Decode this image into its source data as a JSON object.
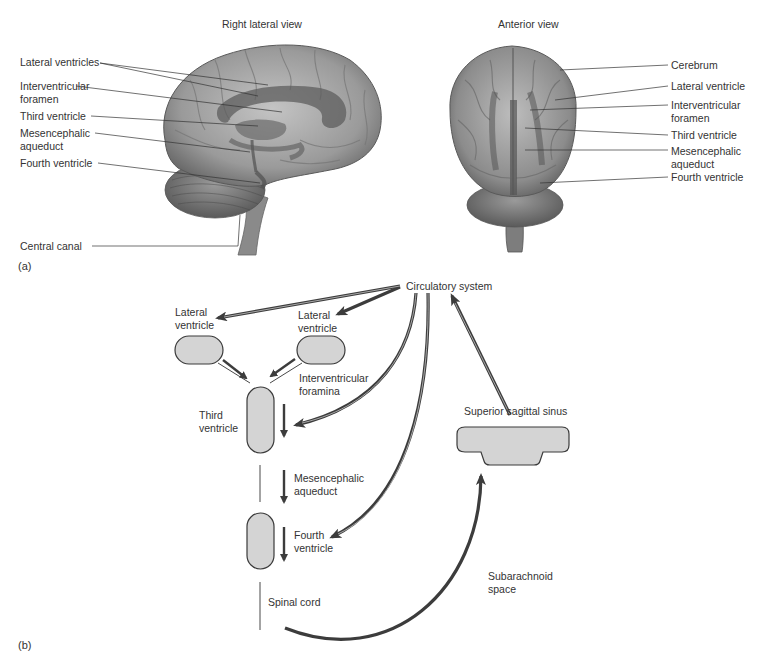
{
  "panel_a": {
    "part_label": "(a)",
    "lateral_view": {
      "title": "Right lateral view",
      "labels": [
        {
          "id": "lateral-ventricles",
          "lines": [
            "Lateral ventricles"
          ]
        },
        {
          "id": "interventricular-foramen",
          "lines": [
            "Interventricular",
            "foramen"
          ]
        },
        {
          "id": "third-ventricle",
          "lines": [
            "Third ventricle"
          ]
        },
        {
          "id": "mesencephalic-aqueduct",
          "lines": [
            "Mesencephalic",
            "aqueduct"
          ]
        },
        {
          "id": "fourth-ventricle",
          "lines": [
            "Fourth ventricle"
          ]
        },
        {
          "id": "central-canal",
          "lines": [
            "Central canal"
          ]
        }
      ]
    },
    "anterior_view": {
      "title": "Anterior view",
      "labels": [
        {
          "id": "cerebrum",
          "lines": [
            "Cerebrum"
          ]
        },
        {
          "id": "lateral-ventricle",
          "lines": [
            "Lateral ventricle"
          ]
        },
        {
          "id": "interventricular-foramen",
          "lines": [
            "Interventricular",
            "foramen"
          ]
        },
        {
          "id": "third-ventricle",
          "lines": [
            "Third ventricle"
          ]
        },
        {
          "id": "mesencephalic-aqueduct",
          "lines": [
            "Mesencephalic",
            "aqueduct"
          ]
        },
        {
          "id": "fourth-ventricle",
          "lines": [
            "Fourth ventricle"
          ]
        }
      ]
    }
  },
  "panel_b": {
    "part_label": "(b)",
    "nodes": {
      "circulatory_system": "Circulatory system",
      "lateral_ventricle_left": [
        "Lateral",
        "ventricle"
      ],
      "lateral_ventricle_right": [
        "Lateral",
        "ventricle"
      ],
      "interventricular_foramina": [
        "Interventricular",
        "foramina"
      ],
      "third_ventricle": [
        "Third",
        "ventricle"
      ],
      "mesencephalic_aqueduct": [
        "Mesencephalic",
        "aqueduct"
      ],
      "fourth_ventricle": [
        "Fourth",
        "ventricle"
      ],
      "spinal_cord": "Spinal cord",
      "superior_sagittal_sinus": "Superior sagittal sinus",
      "subarachnoid_space": [
        "Subarachnoid",
        "space"
      ]
    },
    "flows": [
      {
        "from": "Circulatory system",
        "to": "Lateral ventricle (left)"
      },
      {
        "from": "Circulatory system",
        "to": "Lateral ventricle (right)"
      },
      {
        "from": "Circulatory system",
        "to": "Third ventricle"
      },
      {
        "from": "Circulatory system",
        "to": "Fourth ventricle"
      },
      {
        "from": "Lateral ventricles",
        "to": "Third ventricle",
        "via": "Interventricular foramina"
      },
      {
        "from": "Third ventricle",
        "to": "Fourth ventricle",
        "via": "Mesencephalic aqueduct"
      },
      {
        "from": "Fourth ventricle",
        "to": "Superior sagittal sinus",
        "via": "Subarachnoid space"
      },
      {
        "from": "Superior sagittal sinus",
        "to": "Circulatory system"
      }
    ]
  },
  "colors": {
    "ventricle_fill": "#d4d4d4",
    "outline": "#3a3a3a",
    "arrow": "#3c3c3c",
    "brain_light": "#b8b8b8",
    "brain_dark": "#6e6e6e",
    "ventricle_shade": "#5a5a5a"
  }
}
